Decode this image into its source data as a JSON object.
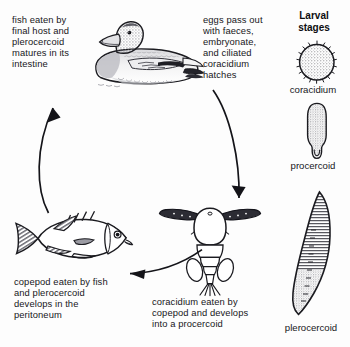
{
  "diagram": {
    "background_color": "#fdfdfd",
    "ink_color": "#17171b"
  },
  "captions": {
    "fish_eaten": "fish eaten by\nfinal host and\nplerocercoid\nmatures in its\nintestine",
    "eggs_pass_out": "eggs pass out\nwith faeces,\nembryonate,\nand ciliated\ncoracidium\nhatches",
    "copepod_eaten": "copepod eaten by fish\nand plerocercoid\ndevelops in the\nperitoneum",
    "coracidium_eaten": "coracidium eaten by\ncopepod and develops\ninto a procercoid"
  },
  "larval_panel": {
    "heading": "Larval\nstages",
    "stages": [
      {
        "name": "coracidium",
        "label": "coracidium",
        "icon": "coracidium-ciliated-sphere"
      },
      {
        "name": "procercoid",
        "label": "procercoid",
        "icon": "procercoid-elongate-body"
      },
      {
        "name": "plerocercoid",
        "label": "plerocercoid",
        "icon": "plerocercoid-leaf-body"
      }
    ]
  },
  "organisms": [
    {
      "name": "duck",
      "icon": "duck-illustration",
      "role": "definitive host"
    },
    {
      "name": "fish",
      "icon": "fish-illustration",
      "role": "second intermediate host"
    },
    {
      "name": "copepod",
      "icon": "copepod-illustration",
      "role": "first intermediate host"
    }
  ],
  "arrows": [
    {
      "name": "fish-to-duck",
      "direction": "up",
      "icon": "curved-arrow-icon"
    },
    {
      "name": "duck-to-copepod",
      "direction": "down",
      "icon": "curved-arrow-icon"
    },
    {
      "name": "copepod-to-fish",
      "direction": "left",
      "icon": "curved-arrow-icon"
    }
  ]
}
